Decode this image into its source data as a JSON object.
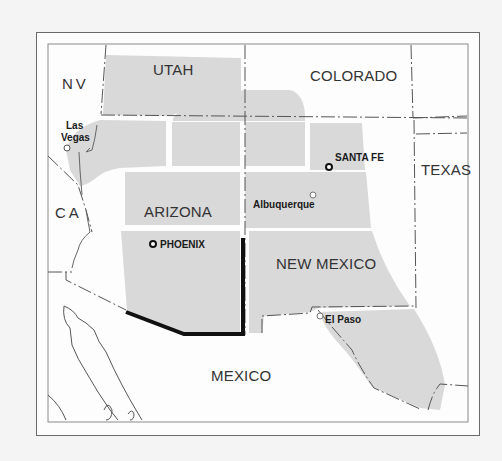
{
  "map": {
    "region": "Southwestern United States",
    "colors": {
      "background": "#f4f4f4",
      "frame_border": "#6a6a6a",
      "state_fill": "#d9d9d9",
      "land": "#fdfdfd",
      "highlight_border": "#111111",
      "label": "#333333"
    },
    "state_labels": {
      "nv": "NV",
      "utah": "UTAH",
      "colorado": "COLORADO",
      "ca": "CA",
      "arizona": "ARIZONA",
      "texas": "TEXAS",
      "new_mexico": "NEW MEXICO",
      "mexico": "MEXICO"
    },
    "cities": {
      "las_vegas": {
        "label": "Las\nVegas",
        "line1": "Las",
        "line2": "Vegas",
        "type": "city"
      },
      "santa_fe": {
        "label": "SANTA FE",
        "type": "capital"
      },
      "albuquerque": {
        "label": "Albuquerque",
        "type": "city"
      },
      "phoenix": {
        "label": "PHOENIX",
        "type": "capital"
      },
      "el_paso": {
        "label": "El Paso",
        "type": "city"
      }
    }
  }
}
